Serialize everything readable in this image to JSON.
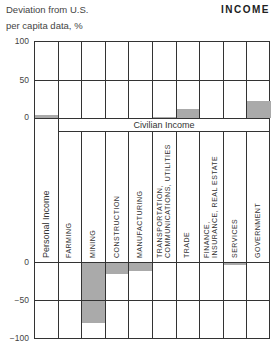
{
  "header": {
    "ylabel_line1": "Deviation from U.S.",
    "ylabel_line2": "per capita data, %",
    "title": "INCOME"
  },
  "group_label": "Civilian Income",
  "y_ticks_upper": [
    "100",
    "50",
    "0"
  ],
  "y_ticks_lower": [
    "0",
    "−50",
    "−100"
  ],
  "categories": [
    "Personal Income",
    "FARMING",
    "MINING",
    "CONSTRUCTION",
    "MANUFACTURING",
    "TRANSPORTATION, COMMUNICATIONS, UTILITIES",
    "TRADE",
    "FINANCE, INSURANCE, REAL ESTATE",
    "SERVICES",
    "GOVERNMENT"
  ],
  "category_lines": [
    [
      "Personal Income"
    ],
    [
      "FARMING"
    ],
    [
      "MINING"
    ],
    [
      "CONSTRUCTION"
    ],
    [
      "MANUFACTURING"
    ],
    [
      "TRANSPORTATION,",
      "COMMUNICATIONS,  UTILITIES"
    ],
    [
      "TRADE"
    ],
    [
      "FINANCE,",
      "INSURANCE,  REAL ESTATE"
    ],
    [
      "SERVICES"
    ],
    [
      "GOVERNMENT"
    ]
  ],
  "colors": {
    "bar": "#aaaaaa",
    "grid": "#333333"
  },
  "chart_data": {
    "type": "bar",
    "title": "INCOME",
    "xlabel": "",
    "ylabel": "Deviation from U.S. per capita data, %",
    "categories": [
      "Personal Income",
      "Farming",
      "Mining",
      "Construction",
      "Manufacturing",
      "Transportation, Communications, Utilities",
      "Trade",
      "Finance, Insurance, Real Estate",
      "Services",
      "Government"
    ],
    "values": [
      4,
      0,
      -80,
      -14,
      -10,
      1,
      12,
      0,
      -2,
      22
    ],
    "group_annotation": "Civilian Income (all categories except Personal Income)",
    "ylim": [
      -100,
      100
    ],
    "y_ticks": [
      -100,
      -50,
      0,
      50,
      100
    ],
    "grid": true,
    "legend": null
  }
}
